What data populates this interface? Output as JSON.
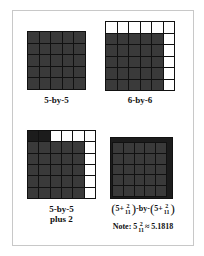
{
  "figure": {
    "panels": [
      {
        "id": "5x5",
        "label": "5-by-5",
        "rows": 5,
        "cols": 5
      },
      {
        "id": "6x6",
        "label": "6-by-6",
        "rows": 6,
        "cols": 6
      },
      {
        "id": "5x5plus2",
        "label_line1": "5-by-5",
        "label_line2": "plus 2",
        "rows": 6,
        "cols": 6
      },
      {
        "id": "fractional",
        "rows": 5,
        "cols": 5
      }
    ],
    "formula": {
      "open": "(",
      "whole": "5+",
      "num": "2",
      "den": "11",
      "close": ")",
      "by": "-by-"
    },
    "note": {
      "prefix": "Note: 5",
      "num": "2",
      "den": "11",
      "suffix": "≈ 5.1818"
    }
  },
  "colors": {
    "filled": "#3a3a3a",
    "empty": "#ffffff",
    "border": "#111111",
    "extra": "#1c1c1c"
  }
}
